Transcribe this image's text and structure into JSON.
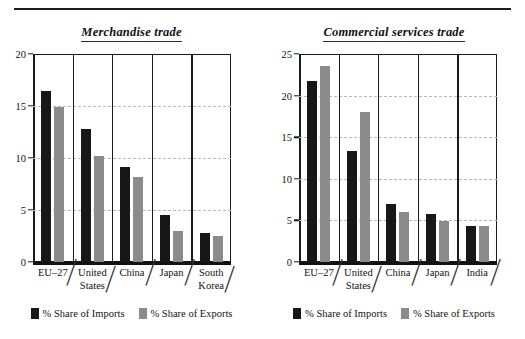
{
  "chart_data": [
    {
      "type": "bar",
      "title": "Merchandise trade",
      "xlabel": "",
      "ylabel": "",
      "ylim": [
        0,
        20
      ],
      "yticks": [
        0,
        5,
        10,
        15,
        20
      ],
      "grid": true,
      "legend_position": "bottom",
      "categories": [
        "EU–27",
        "United States",
        "China",
        "Japan",
        "South Korea"
      ],
      "category_lines": [
        [
          "EU–27"
        ],
        [
          "United",
          "States"
        ],
        [
          "China"
        ],
        [
          "Japan"
        ],
        [
          "South",
          "Korea"
        ]
      ],
      "series": [
        {
          "name": "% Share of Imports",
          "color": "#171717",
          "values": [
            16.4,
            12.8,
            9.1,
            4.5,
            2.8
          ]
        },
        {
          "name": "% Share of Exports",
          "color": "#8b8b8b",
          "values": [
            14.9,
            10.2,
            8.2,
            3.0,
            2.5
          ]
        }
      ]
    },
    {
      "type": "bar",
      "title": "Commercial services trade",
      "xlabel": "",
      "ylabel": "",
      "ylim": [
        0,
        25
      ],
      "yticks": [
        0,
        5,
        10,
        15,
        20,
        25
      ],
      "grid": true,
      "legend_position": "bottom",
      "categories": [
        "EU–27",
        "United States",
        "China",
        "Japan",
        "India"
      ],
      "category_lines": [
        [
          "EU–27"
        ],
        [
          "United",
          "States"
        ],
        [
          "China"
        ],
        [
          "Japan"
        ],
        [
          "India"
        ]
      ],
      "series": [
        {
          "name": "% Share of Imports",
          "color": "#171717",
          "values": [
            21.7,
            13.3,
            7.0,
            5.8,
            4.3
          ]
        },
        {
          "name": "% Share of Exports",
          "color": "#8b8b8b",
          "values": [
            23.6,
            18.0,
            6.0,
            4.9,
            4.3
          ]
        }
      ]
    }
  ],
  "figure": {
    "brace_glyph": "⎠"
  }
}
